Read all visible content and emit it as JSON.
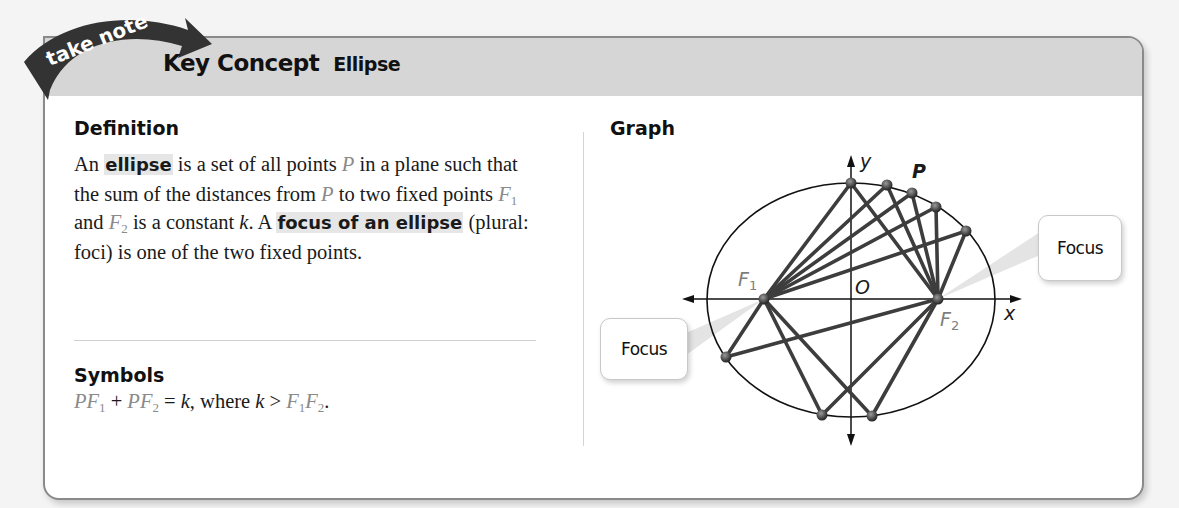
{
  "banner": {
    "text": "take note",
    "color": "#3a3a3a"
  },
  "header": {
    "title": "Key Concept",
    "subtitle": "Ellipse",
    "band_color": "#d6d6d6"
  },
  "definition": {
    "heading": "Definition",
    "parts": {
      "p1": "An ",
      "term1": "ellipse",
      "p2": " is a set of all points ",
      "P": "P",
      "p3": " in a plane such that the sum of the distances from ",
      "P2": "P",
      "p4": " to two fixed points ",
      "F1": "F",
      "F1sub": "1",
      "p5": " and ",
      "F2": "F",
      "F2sub": "2",
      "p6": " is a constant ",
      "k": "k",
      "p7": ". A ",
      "term2": "focus of an ellipse",
      "p8": " (plural: foci) is one of the two fixed points."
    }
  },
  "symbols": {
    "heading": "Symbols",
    "formula": {
      "a": "PF",
      "a_sub": "1",
      "plus": " + ",
      "b": "PF",
      "b_sub": "2",
      "eq": " = ",
      "k": "k",
      "where": ", where ",
      "k2": "k",
      "gt": " > ",
      "c": "F",
      "c_sub": "1",
      "d": "F",
      "d_sub": "2",
      "end": "."
    }
  },
  "graph": {
    "heading": "Graph",
    "labels": {
      "y_axis": "y",
      "x_axis": "x",
      "origin": "O",
      "point": "P",
      "f1": "F",
      "f1_sub": "1",
      "f2": "F",
      "f2_sub": "2"
    },
    "callouts": {
      "left": "Focus",
      "right": "Focus"
    },
    "geometry": {
      "center": [
        851,
        299
      ],
      "rx": 144,
      "ry": 116,
      "F1": [
        764,
        299
      ],
      "F2": [
        938,
        299
      ],
      "points": [
        [
          851,
          183
        ],
        [
          887,
          185
        ],
        [
          912,
          193
        ],
        [
          936,
          207
        ],
        [
          966,
          231
        ],
        [
          726,
          357
        ],
        [
          822,
          415
        ],
        [
          872,
          416
        ]
      ]
    }
  }
}
